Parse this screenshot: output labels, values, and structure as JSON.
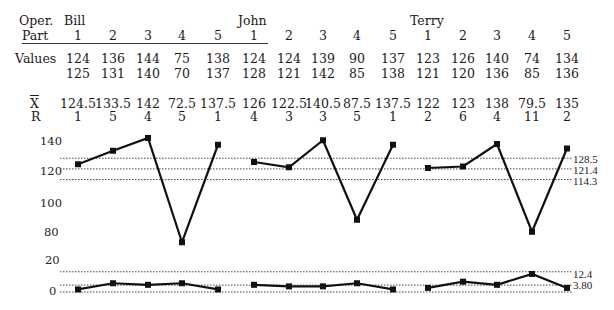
{
  "table": {
    "row_labels": {
      "operator": "Oper.",
      "part": "Part",
      "values": "Values",
      "xbar": "X",
      "range": "R"
    },
    "operators": [
      "Bill",
      "John",
      "Terry"
    ],
    "parts": [
      "1",
      "2",
      "3",
      "4",
      "5",
      "1",
      "2",
      "3",
      "4",
      "5",
      "1",
      "2",
      "3",
      "4",
      "5"
    ],
    "values_row1": [
      "124",
      "136",
      "144",
      "75",
      "138",
      "124",
      "124",
      "139",
      "90",
      "137",
      "123",
      "126",
      "140",
      "74",
      "134"
    ],
    "values_row2": [
      "125",
      "131",
      "140",
      "70",
      "137",
      "128",
      "121",
      "142",
      "85",
      "138",
      "121",
      "120",
      "136",
      "85",
      "136"
    ],
    "xbar": [
      "124.5",
      "133.5",
      "142",
      "72.5",
      "137.5",
      "126",
      "122.5",
      "140.5",
      "87.5",
      "137.5",
      "122",
      "123",
      "138",
      "79.5",
      "135"
    ],
    "range": [
      "1",
      "5",
      "4",
      "5",
      "1",
      "4",
      "3",
      "3",
      "5",
      "1",
      "2",
      "6",
      "4",
      "11",
      "2"
    ]
  },
  "chart_data": [
    {
      "type": "line",
      "title": "X-bar chart",
      "xlabel": "",
      "ylabel": "",
      "y_tick_labels": [
        "140",
        "120",
        "100",
        "80"
      ],
      "categories": [
        "Bill 1",
        "Bill 2",
        "Bill 3",
        "Bill 4",
        "Bill 5",
        "John 1",
        "John 2",
        "John 3",
        "John 4",
        "John 5",
        "Terry 1",
        "Terry 2",
        "Terry 3",
        "Terry 4",
        "Terry 5"
      ],
      "series": [
        {
          "name": "Bill",
          "values": [
            124.5,
            133.5,
            142,
            72.5,
            137.5
          ]
        },
        {
          "name": "John",
          "values": [
            126,
            122.5,
            140.5,
            87.5,
            137.5
          ]
        },
        {
          "name": "Terry",
          "values": [
            122,
            123,
            138,
            79.5,
            135
          ]
        }
      ],
      "control_limits": {
        "UCL": 128.5,
        "CL": 121.4,
        "LCL": 114.3
      },
      "control_limit_labels": [
        "128.5",
        "121.4",
        "114.3"
      ],
      "grid": false
    },
    {
      "type": "line",
      "title": "Range chart",
      "xlabel": "",
      "ylabel": "",
      "y_tick_labels": [
        "20",
        "0"
      ],
      "categories": [
        "Bill 1",
        "Bill 2",
        "Bill 3",
        "Bill 4",
        "Bill 5",
        "John 1",
        "John 2",
        "John 3",
        "John 4",
        "John 5",
        "Terry 1",
        "Terry 2",
        "Terry 3",
        "Terry 4",
        "Terry 5"
      ],
      "series": [
        {
          "name": "Bill",
          "values": [
            1,
            5,
            4,
            5,
            1
          ]
        },
        {
          "name": "John",
          "values": [
            4,
            3,
            3,
            5,
            1
          ]
        },
        {
          "name": "Terry",
          "values": [
            2,
            6,
            4,
            11,
            2
          ]
        }
      ],
      "control_limits": {
        "UCL": 12.4,
        "CL": 3.8,
        "LCL": 0
      },
      "control_limit_labels": [
        "12.4",
        "3.80"
      ],
      "grid": false
    }
  ]
}
